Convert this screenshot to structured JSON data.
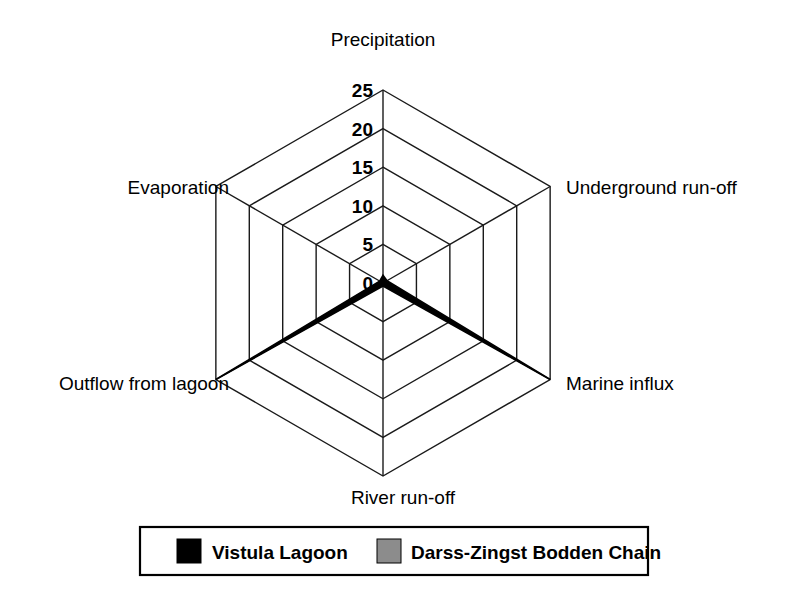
{
  "chart_data": {
    "type": "radar",
    "title": "",
    "categories": [
      "Precipitation",
      "Underground run-off",
      "Marine influx",
      "River run-off",
      "Outflow from lagoon",
      "Evaporation"
    ],
    "tick_labels": [
      "0",
      "5",
      "10",
      "15",
      "20",
      "25"
    ],
    "tick_values": [
      0,
      5,
      10,
      15,
      20,
      25
    ],
    "rlim": [
      0,
      25
    ],
    "grid": true,
    "legend_position": "bottom",
    "series": [
      {
        "name": "Vistula Lagoon",
        "color": "#000000",
        "values": [
          1.0,
          0.6,
          25.0,
          0.4,
          25.0,
          0.5
        ]
      },
      {
        "name": "Darss-Zingst Bodden Chain",
        "color": "#8c8c8c",
        "values": [
          0.6,
          0.4,
          23.0,
          0.3,
          23.0,
          0.3
        ]
      }
    ],
    "xlabel": "",
    "ylabel": ""
  },
  "axis_titles": {
    "precipitation": "Precipitation",
    "underground_runoff": "Underground run-off",
    "marine_influx": "Marine influx",
    "river_runoff": "River run-off",
    "outflow_from_lagoon": "Outflow from lagoon",
    "evaporation": "Evaporation"
  },
  "ticks": {
    "t0": "0",
    "t5": "5",
    "t10": "10",
    "t15": "15",
    "t20": "20",
    "t25": "25"
  },
  "legend": {
    "items": [
      {
        "label": "Vistula Lagoon",
        "color": "#000000"
      },
      {
        "label": "Darss-Zingst Bodden Chain",
        "color": "#8c8c8c"
      }
    ],
    "item_0_label": "Vistula Lagoon",
    "item_1_label": "Darss-Zingst Bodden Chain"
  },
  "colors": {
    "background": "#ffffff",
    "grid": "#1a1a1a",
    "series_black": "#000000",
    "series_gray": "#8c8c8c"
  }
}
